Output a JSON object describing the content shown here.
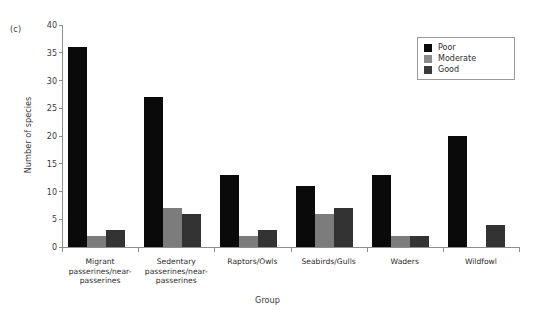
{
  "figure": {
    "panel_label": "(c)",
    "background": "#ffffff"
  },
  "chart_data": {
    "type": "bar",
    "title": "",
    "panel": "(c)",
    "xlabel": "Group",
    "ylabel": "Number of species",
    "ylim": [
      0,
      40
    ],
    "yticks": [
      0,
      5,
      10,
      15,
      20,
      25,
      30,
      35,
      40
    ],
    "grid": false,
    "legend_position": "top-right",
    "categories": [
      "Migrant passerines/near-passerines",
      "Sedentary passerines/near-passerines",
      "Raptors/Owls",
      "Seabirds/Gulls",
      "Waders",
      "Wildfowl"
    ],
    "category_lines": [
      "Migrant\npasserines/near-\npasserines",
      "Sedentary\npasserines/near-\npasserines",
      "Raptors/Owls",
      "Seabirds/Gulls",
      "Waders",
      "Wildfowl"
    ],
    "series": [
      {
        "name": "Poor",
        "color": "#0a0a0a",
        "values": [
          36,
          27,
          13,
          11,
          13,
          20
        ]
      },
      {
        "name": "Moderate",
        "color": "#7c7c7c",
        "values": [
          2,
          7,
          2,
          6,
          2,
          0
        ]
      },
      {
        "name": "Good",
        "color": "#333333",
        "values": [
          3,
          6,
          3,
          7,
          2,
          4
        ]
      }
    ]
  },
  "legend": {
    "items": [
      {
        "label": "Poor",
        "color": "#0a0a0a"
      },
      {
        "label": "Moderate",
        "color": "#8a8a8a"
      },
      {
        "label": "Good",
        "color": "#3b3b3b"
      }
    ]
  }
}
